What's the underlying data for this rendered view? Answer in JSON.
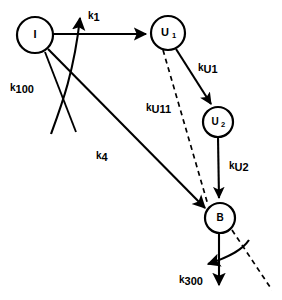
{
  "diagram": {
    "type": "compartment-flow-diagram",
    "background_color": "#ffffff",
    "stroke_color": "#000000",
    "nodes": [
      {
        "id": "I",
        "label": "I",
        "sub": "",
        "cx": 35,
        "cy": 35,
        "r": 18
      },
      {
        "id": "U1",
        "label": "U",
        "sub": "1",
        "cx": 168,
        "cy": 33,
        "r": 17
      },
      {
        "id": "U2",
        "label": "U",
        "sub": "2",
        "cx": 218,
        "cy": 122,
        "r": 15
      },
      {
        "id": "B",
        "label": "B",
        "sub": "",
        "cx": 220,
        "cy": 218,
        "r": 15
      }
    ],
    "rates": [
      {
        "id": "k1",
        "k": "k",
        "sub": "1",
        "x": 88,
        "y": 8,
        "from": "I",
        "to": "U1",
        "style": "solid"
      },
      {
        "id": "k100",
        "k": "k",
        "sub": "100",
        "x": 10,
        "y": 80,
        "from": "I",
        "to": "",
        "style": "solid"
      },
      {
        "id": "k4",
        "k": "k",
        "sub": "4",
        "x": 96,
        "y": 148,
        "from": "I",
        "to": "B",
        "style": "solid"
      },
      {
        "id": "kU1",
        "k": "k",
        "sub": "U1",
        "x": 198,
        "y": 60,
        "from": "U1",
        "to": "U2",
        "style": "solid"
      },
      {
        "id": "kU11",
        "k": "k",
        "sub": "U11",
        "x": 146,
        "y": 100,
        "from": "U1",
        "to": "B",
        "style": "dashed"
      },
      {
        "id": "kU2",
        "k": "k",
        "sub": "U2",
        "x": 229,
        "y": 158,
        "from": "U2",
        "to": "B",
        "style": "solid"
      },
      {
        "id": "k300",
        "k": "k",
        "sub": "300",
        "x": 179,
        "y": 272,
        "from": "B",
        "to": "",
        "style": "solid"
      }
    ]
  }
}
